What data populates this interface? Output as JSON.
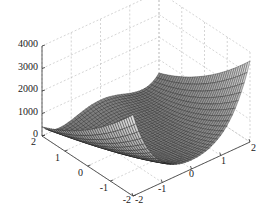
{
  "chart_data": {
    "type": "surface3d",
    "title": "",
    "function_guess": "(1-x)^2 + 100*(y-x^2)^2",
    "x": {
      "label": "",
      "range": [
        -2,
        2
      ],
      "ticks": [
        "-2",
        "-1",
        "0",
        "1",
        "2"
      ]
    },
    "y": {
      "label": "",
      "range": [
        -2,
        2
      ],
      "ticks": [
        "2",
        "1",
        "0",
        "-1",
        "-2"
      ]
    },
    "z": {
      "label": "",
      "range": [
        0,
        4000
      ],
      "ticks": [
        "0",
        "1000",
        "2000",
        "3000",
        "4000"
      ]
    },
    "grid": true,
    "mesh_resolution": 41,
    "colormap": "gray",
    "notable_points": [
      {
        "x": 2,
        "y": -2,
        "z": 3601
      },
      {
        "x": -2,
        "y": -2,
        "z": 3609
      },
      {
        "x": 1,
        "y": 1,
        "z": 0
      }
    ]
  }
}
